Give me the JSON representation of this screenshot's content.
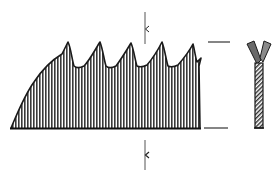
{
  "figure": {
    "title": "Saw blade tooth profile with set cross-section",
    "colors": {
      "ink": "#1a1a1a",
      "hatch": "#3a3a3a",
      "hatch_light": "#9a9a9a",
      "background": "#ffffff"
    },
    "blade": {
      "tooth_count": 5,
      "baseline_y": 128,
      "baseline_x": [
        11,
        200
      ],
      "tooth_peaks": [
        {
          "x": 68,
          "y": 42
        },
        {
          "x": 100,
          "y": 42
        },
        {
          "x": 131,
          "y": 43
        },
        {
          "x": 162,
          "y": 42
        },
        {
          "x": 193,
          "y": 44
        }
      ],
      "gullets": [
        {
          "x": 78,
          "y": 67
        },
        {
          "x": 110,
          "y": 67
        },
        {
          "x": 141,
          "y": 66
        },
        {
          "x": 172,
          "y": 66
        }
      ],
      "fill": "vertical-hatching"
    },
    "dimension_markers": [
      {
        "name": "pitch-marker-top",
        "x": 145,
        "y1": 12,
        "y2": 44,
        "tick_y": 29
      },
      {
        "name": "pitch-marker-bottom",
        "x": 145,
        "y1": 140,
        "y2": 170,
        "tick_y": 155
      }
    ],
    "extension_lines": [
      {
        "name": "tooth-height-top",
        "x1": 208,
        "x2": 230,
        "y": 42
      },
      {
        "name": "tooth-height-bottom",
        "x1": 204,
        "x2": 228,
        "y": 128
      }
    ],
    "cross_section": {
      "shape": "Y",
      "label": "set-teeth-section",
      "x": 248,
      "y_top": 40,
      "y_bottom": 128
    }
  }
}
